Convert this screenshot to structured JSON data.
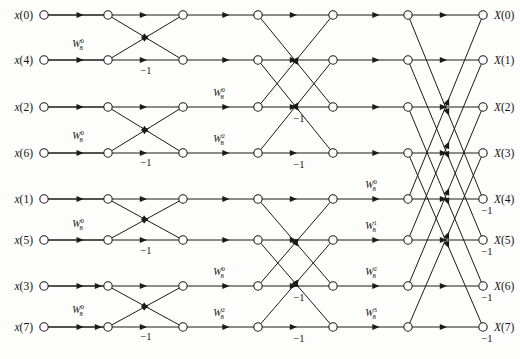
{
  "figure": {
    "type": "signal-flow-graph",
    "name": "8-point radix-2 decimation-in-time FFT butterfly diagram",
    "width": 520,
    "height": 359,
    "background": "#fdfdfb",
    "line_color": "#1a1a1a",
    "node_fill": "#ffffff"
  },
  "inputs": [
    {
      "label": "x(0)",
      "var": "x",
      "index": "(0)",
      "row": 0,
      "y": 15
    },
    {
      "label": "x(4)",
      "var": "x",
      "index": "(4)",
      "row": 1,
      "y": 60
    },
    {
      "label": "x(2)",
      "var": "x",
      "index": "(2)",
      "row": 2,
      "y": 107
    },
    {
      "label": "x(6)",
      "var": "x",
      "index": "(6)",
      "row": 3,
      "y": 153
    },
    {
      "label": "x(1)",
      "var": "x",
      "index": "(1)",
      "row": 4,
      "y": 199
    },
    {
      "label": "x(5)",
      "var": "x",
      "index": "(5)",
      "row": 5,
      "y": 240
    },
    {
      "label": "x(3)",
      "var": "x",
      "index": "(3)",
      "row": 6,
      "y": 286
    },
    {
      "label": "x(7)",
      "var": "x",
      "index": "(7)",
      "row": 7,
      "y": 327
    }
  ],
  "outputs": [
    {
      "label": "X(0)",
      "var": "X",
      "index": "(0)",
      "row": 0,
      "y": 15
    },
    {
      "label": "X(1)",
      "var": "X",
      "index": "(1)",
      "row": 1,
      "y": 60
    },
    {
      "label": "X(2)",
      "var": "X",
      "index": "(2)",
      "row": 2,
      "y": 107
    },
    {
      "label": "X(3)",
      "var": "X",
      "index": "(3)",
      "row": 3,
      "y": 153
    },
    {
      "label": "X(4)",
      "var": "X",
      "index": "(4)",
      "row": 4,
      "y": 199
    },
    {
      "label": "X(5)",
      "var": "X",
      "index": "(5)",
      "row": 5,
      "y": 240
    },
    {
      "label": "X(6)",
      "var": "X",
      "index": "(6)",
      "row": 6,
      "y": 286
    },
    {
      "label": "X(7)",
      "var": "X",
      "index": "(7)",
      "row": 7,
      "y": 327
    }
  ],
  "node_columns": [
    44,
    108,
    183,
    258,
    333,
    408,
    483
  ],
  "row_y": [
    15,
    60,
    107,
    153,
    199,
    240,
    286,
    327
  ],
  "stages": [
    {
      "id": 1,
      "span": 1,
      "from_col": 1,
      "to_col": 2,
      "pairs": [
        [
          0,
          1
        ],
        [
          2,
          3
        ],
        [
          4,
          5
        ],
        [
          6,
          7
        ]
      ],
      "twiddles": [
        {
          "base": "W",
          "sub": "8",
          "sup": "0",
          "text": "W80",
          "x": 78,
          "y": 47,
          "row_pair": [
            0,
            1
          ]
        },
        {
          "base": "W",
          "sub": "8",
          "sup": "0",
          "text": "W80",
          "x": 78,
          "y": 139,
          "row_pair": [
            2,
            3
          ]
        },
        {
          "base": "W",
          "sub": "8",
          "sup": "0",
          "text": "W80",
          "x": 78,
          "y": 227,
          "row_pair": [
            4,
            5
          ]
        },
        {
          "base": "W",
          "sub": "8",
          "sup": "0",
          "text": "W80",
          "x": 78,
          "y": 313,
          "row_pair": [
            6,
            7
          ]
        }
      ],
      "minus_ones": [
        {
          "text": "-1",
          "x": 146,
          "y": 74
        },
        {
          "text": "-1",
          "x": 146,
          "y": 166
        },
        {
          "text": "-1",
          "x": 146,
          "y": 254
        },
        {
          "text": "-1",
          "x": 146,
          "y": 340
        }
      ]
    },
    {
      "id": 2,
      "span": 2,
      "from_col": 3,
      "to_col": 4,
      "pairs": [
        [
          0,
          2
        ],
        [
          1,
          3
        ],
        [
          4,
          6
        ],
        [
          5,
          7
        ]
      ],
      "twiddles": [
        {
          "base": "W",
          "sub": "8",
          "sup": "0",
          "text": "W80",
          "x": 219,
          "y": 96,
          "row_pair": [
            0,
            2
          ]
        },
        {
          "base": "W",
          "sub": "8",
          "sup": "2",
          "text": "W82",
          "x": 219,
          "y": 142,
          "row_pair": [
            1,
            3
          ]
        },
        {
          "base": "W",
          "sub": "8",
          "sup": "0",
          "text": "W80",
          "x": 219,
          "y": 275,
          "row_pair": [
            4,
            6
          ]
        },
        {
          "base": "W",
          "sub": "8",
          "sup": "2",
          "text": "W82",
          "x": 219,
          "y": 316,
          "row_pair": [
            5,
            7
          ]
        }
      ],
      "minus_ones": [
        {
          "text": "-1",
          "x": 299,
          "y": 122
        },
        {
          "text": "-1",
          "x": 299,
          "y": 168
        },
        {
          "text": "-1",
          "x": 299,
          "y": 301
        },
        {
          "text": "-1",
          "x": 299,
          "y": 342
        }
      ]
    },
    {
      "id": 3,
      "span": 4,
      "from_col": 5,
      "to_col": 6,
      "pairs": [
        [
          0,
          4
        ],
        [
          1,
          5
        ],
        [
          2,
          6
        ],
        [
          3,
          7
        ]
      ],
      "twiddles": [
        {
          "base": "W",
          "sub": "8",
          "sup": "0",
          "text": "W80",
          "x": 371,
          "y": 188,
          "row_pair": [
            0,
            4
          ]
        },
        {
          "base": "W",
          "sub": "8",
          "sup": "1",
          "text": "W81",
          "x": 371,
          "y": 229,
          "row_pair": [
            1,
            5
          ]
        },
        {
          "base": "W",
          "sub": "8",
          "sup": "2",
          "text": "W82",
          "x": 371,
          "y": 275,
          "row_pair": [
            2,
            6
          ]
        },
        {
          "base": "W",
          "sub": "8",
          "sup": "3",
          "text": "W83",
          "x": 371,
          "y": 316,
          "row_pair": [
            3,
            7
          ]
        }
      ],
      "minus_ones": [
        {
          "text": "-1",
          "x": 487,
          "y": 214
        },
        {
          "text": "-1",
          "x": 487,
          "y": 255
        },
        {
          "text": "-1",
          "x": 487,
          "y": 301
        },
        {
          "text": "-1",
          "x": 487,
          "y": 342
        }
      ]
    }
  ],
  "twiddle_glyphs": {
    "W80": {
      "base": "W",
      "sub": "8",
      "sup": "0"
    },
    "W81": {
      "base": "W",
      "sub": "8",
      "sup": "1"
    },
    "W82": {
      "base": "W",
      "sub": "8",
      "sup": "2"
    },
    "W83": {
      "base": "W",
      "sub": "8",
      "sup": "3"
    }
  },
  "minus_one_label": "−1"
}
